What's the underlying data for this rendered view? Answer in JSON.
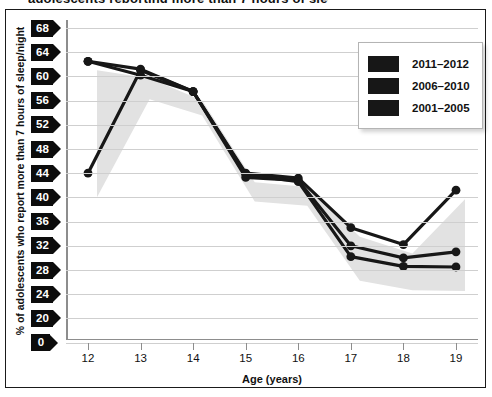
{
  "figure": {
    "title_fragment": "adolescents reporting more than 7 hours of sleep",
    "frame_color": "#1a1a1a",
    "background": "#ffffff"
  },
  "axes": {
    "y_label": "% of adolescents who report more than 7 hours of sleep/night",
    "x_label": "Age (years)",
    "y_ticks": [
      "68",
      "64",
      "60",
      "56",
      "52",
      "48",
      "44",
      "40",
      "36",
      "32",
      "28",
      "24",
      "20",
      "0"
    ],
    "x_ticks": [
      "12",
      "13",
      "14",
      "15",
      "16",
      "17",
      "18",
      "19"
    ]
  },
  "legend": {
    "position": "top-right-inside",
    "items": [
      {
        "label": "2011–2012",
        "color": "#171717"
      },
      {
        "label": "2006–2010",
        "color": "#171717"
      },
      {
        "label": "2001–2005",
        "color": "#171717"
      }
    ]
  },
  "chart_data": {
    "type": "line",
    "xlabel": "Age (years)",
    "ylabel": "% of adolescents who report more than 7 hours of sleep/night",
    "x": [
      12,
      13,
      14,
      15,
      16,
      17,
      18,
      19
    ],
    "categories": [
      "12",
      "13",
      "14",
      "15",
      "16",
      "17",
      "18",
      "19"
    ],
    "ylim": [
      18,
      70
    ],
    "y_axis_break_at_zero": true,
    "grid": true,
    "legend_position": "upper right",
    "marker": "circle",
    "line_color": "#171717",
    "band_color": "#e2e2e2",
    "series": [
      {
        "name": "2011–2012",
        "values": [
          62.5,
          60.2,
          57.5,
          44.0,
          43.2,
          35.0,
          32.2,
          41.2
        ]
      },
      {
        "name": "2006–2010",
        "values": [
          62.5,
          61.2,
          57.5,
          43.3,
          42.8,
          32.0,
          30.0,
          31.0
        ]
      },
      {
        "name": "2001–2005",
        "values": [
          44.0,
          61.0,
          57.5,
          43.8,
          42.6,
          30.2,
          28.6,
          28.5
        ]
      }
    ],
    "shaded_band": {
      "description": "light gray shadow band behind the series",
      "color": "#e2e2e2"
    }
  }
}
